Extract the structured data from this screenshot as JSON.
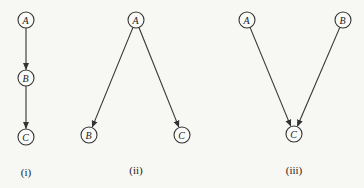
{
  "diagrams": [
    {
      "caption": "(i)",
      "caption_pos": [
        26,
        176
      ],
      "nodes": [
        {
          "id": "A",
          "label": "A",
          "x": 26,
          "y": 20
        },
        {
          "id": "B",
          "label": "B",
          "x": 26,
          "y": 78
        },
        {
          "id": "C",
          "label": "C",
          "x": 26,
          "y": 137
        }
      ],
      "edges": [
        {
          "from": "A",
          "to": "B"
        },
        {
          "from": "B",
          "to": "C"
        }
      ]
    },
    {
      "caption": "(ii)",
      "caption_pos": [
        136,
        174
      ],
      "nodes": [
        {
          "id": "A",
          "label": "A",
          "x": 136,
          "y": 20
        },
        {
          "id": "B",
          "label": "B",
          "x": 89,
          "y": 135
        },
        {
          "id": "C",
          "label": "C",
          "x": 182,
          "y": 135
        }
      ],
      "edges": [
        {
          "from": "A",
          "to": "B"
        },
        {
          "from": "A",
          "to": "C"
        }
      ]
    },
    {
      "caption": "(iii)",
      "caption_pos": [
        294,
        174
      ],
      "nodes": [
        {
          "id": "A",
          "label": "A",
          "x": 247,
          "y": 20
        },
        {
          "id": "B",
          "label": "B",
          "x": 343,
          "y": 20
        },
        {
          "id": "C",
          "label": "C",
          "x": 294,
          "y": 134
        }
      ],
      "edges": [
        {
          "from": "A",
          "to": "C"
        },
        {
          "from": "B",
          "to": "C"
        }
      ]
    }
  ],
  "style": {
    "node_radius": 8,
    "line_color": "#333333",
    "background": "#f7f7f4"
  }
}
